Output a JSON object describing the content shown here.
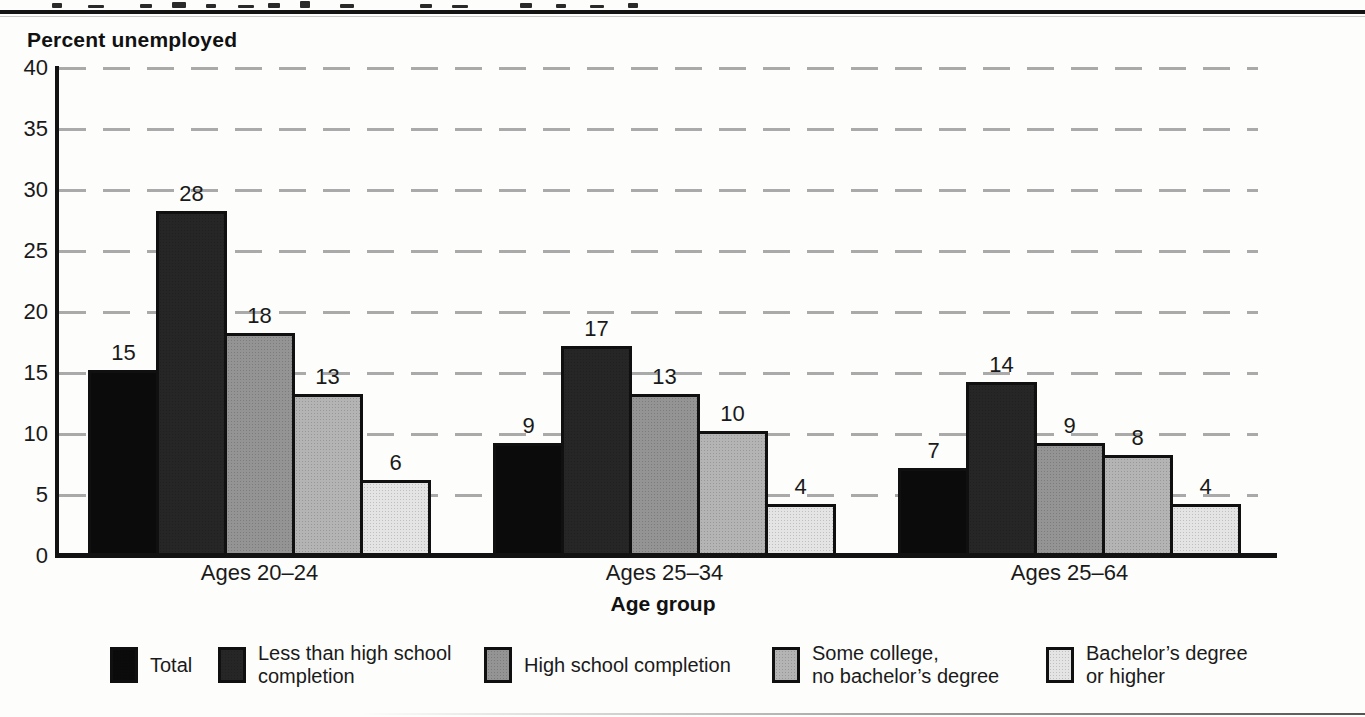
{
  "chart_data": {
    "type": "bar",
    "title": "",
    "ylabel": "Percent unemployed",
    "xlabel": "Age group",
    "ylim": [
      0,
      40
    ],
    "yticks": [
      0,
      5,
      10,
      15,
      20,
      25,
      30,
      35,
      40
    ],
    "grid": "horizontal-dashed",
    "legend_position": "bottom",
    "bar_value_labels": true,
    "categories": [
      "Ages 20–24",
      "Ages 25–34",
      "Ages 25–64"
    ],
    "series": [
      {
        "name": "Total",
        "color": "#0b0b0b",
        "values": [
          15,
          9,
          7
        ]
      },
      {
        "name": "Less than high school completion",
        "color": "#262626",
        "values": [
          28,
          17,
          14
        ]
      },
      {
        "name": "High school completion",
        "color": "#949494",
        "values": [
          18,
          13,
          9
        ]
      },
      {
        "name": "Some college, no bachelor’s degree",
        "color": "#b4b4b4",
        "values": [
          13,
          10,
          8
        ]
      },
      {
        "name": "Bachelor’s degree or higher",
        "color": "#e4e4e4",
        "values": [
          6,
          4,
          4
        ]
      }
    ]
  },
  "legend": {
    "items": [
      {
        "lines": [
          "Total"
        ]
      },
      {
        "lines": [
          "Less than high school",
          "completion"
        ]
      },
      {
        "lines": [
          "High school completion"
        ]
      },
      {
        "lines": [
          "Some college,",
          "no bachelor’s degree"
        ]
      },
      {
        "lines": [
          "Bachelor’s degree",
          "or higher"
        ]
      }
    ]
  }
}
